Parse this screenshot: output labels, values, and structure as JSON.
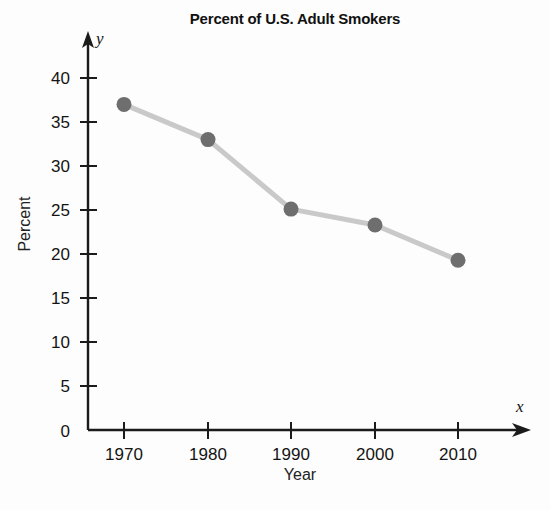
{
  "chart_data": {
    "type": "line",
    "title": "Percent of U.S. Adult Smokers",
    "xlabel": "Year",
    "ylabel": "Percent",
    "x_axis_variable": "x",
    "y_axis_variable": "y",
    "categories": [
      1970,
      1980,
      1990,
      2000,
      2010
    ],
    "x_tick_labels": [
      "1970",
      "1980",
      "1990",
      "2000",
      "2010"
    ],
    "values": [
      37,
      33,
      25.1,
      23.3,
      19.3
    ],
    "series": [
      {
        "name": "Percent of U.S. Adult Smokers",
        "values": [
          37,
          33,
          25.1,
          23.3,
          19.3
        ]
      }
    ],
    "y_tick_labels": [
      "0",
      "5",
      "10",
      "15",
      "20",
      "25",
      "30",
      "35",
      "40"
    ],
    "y_ticks": [
      0,
      5,
      10,
      15,
      20,
      25,
      30,
      35,
      40
    ],
    "ylim": [
      0,
      40
    ],
    "xlim": [
      1965,
      2015
    ],
    "grid": false,
    "legend": false,
    "marker_color": "#6e6e6e",
    "line_color": "#c9c9c9",
    "axis_color": "#1b1b1b",
    "background_color": "#fdfdfd"
  }
}
